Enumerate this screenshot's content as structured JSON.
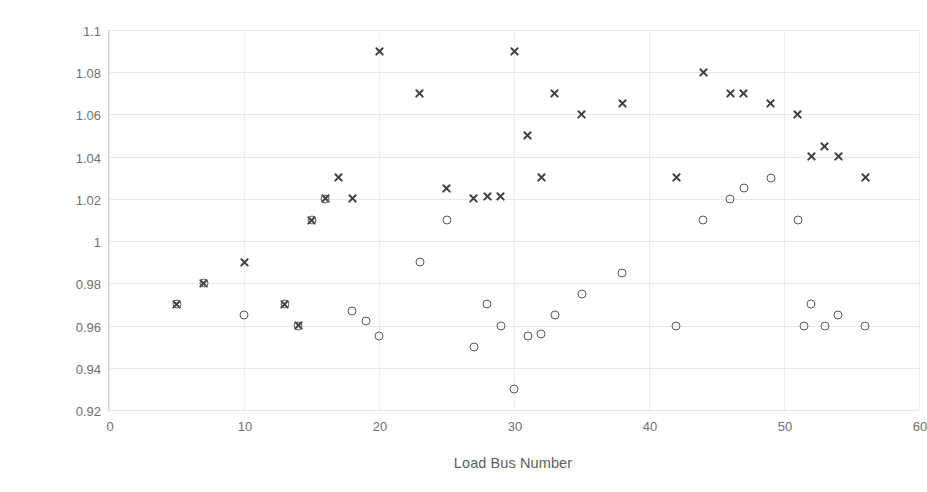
{
  "chart_data": {
    "type": "scatter",
    "title": "",
    "xlabel": "Load Bus Number",
    "ylabel": "Voltage Magnitude in p.u.",
    "xlim": [
      0,
      60
    ],
    "ylim": [
      0.92,
      1.1
    ],
    "xticks": [
      0,
      10,
      20,
      30,
      40,
      50,
      60
    ],
    "yticks": [
      "0.92",
      "0.94",
      "0.96",
      "0.98",
      "1",
      "1.02",
      "1.04",
      "1.06",
      "1.08",
      "1.1"
    ],
    "grid": true,
    "legend": "none",
    "marker_colors": {
      "cross": "#3f3f45",
      "circle": "#5a5a62"
    },
    "series": [
      {
        "name": "series-cross",
        "marker": "x",
        "points": [
          [
            5,
            0.97
          ],
          [
            7,
            0.98
          ],
          [
            10,
            0.99
          ],
          [
            13,
            0.97
          ],
          [
            14,
            0.96
          ],
          [
            15,
            1.01
          ],
          [
            16,
            1.02
          ],
          [
            17,
            1.03
          ],
          [
            18,
            1.02
          ],
          [
            20,
            1.09
          ],
          [
            23,
            1.07
          ],
          [
            25,
            1.025
          ],
          [
            27,
            1.02
          ],
          [
            28,
            1.021
          ],
          [
            29,
            1.021
          ],
          [
            30,
            1.09
          ],
          [
            31,
            1.05
          ],
          [
            32,
            1.03
          ],
          [
            33,
            1.07
          ],
          [
            35,
            1.06
          ],
          [
            38,
            1.065
          ],
          [
            42,
            1.03
          ],
          [
            44,
            1.08
          ],
          [
            46,
            1.07
          ],
          [
            47,
            1.07
          ],
          [
            49,
            1.065
          ],
          [
            51,
            1.06
          ],
          [
            52,
            1.04
          ],
          [
            53,
            1.045
          ],
          [
            54,
            1.04
          ],
          [
            56,
            1.03
          ]
        ]
      },
      {
        "name": "series-circle",
        "marker": "o",
        "points": [
          [
            5,
            0.97
          ],
          [
            7,
            0.98
          ],
          [
            10,
            0.965
          ],
          [
            13,
            0.97
          ],
          [
            14,
            0.96
          ],
          [
            15,
            1.01
          ],
          [
            16,
            1.02
          ],
          [
            18,
            0.967
          ],
          [
            19,
            0.962
          ],
          [
            20,
            0.955
          ],
          [
            23,
            0.99
          ],
          [
            25,
            1.01
          ],
          [
            27,
            0.95
          ],
          [
            28,
            0.97
          ],
          [
            29,
            0.96
          ],
          [
            30,
            0.93
          ],
          [
            31,
            0.955
          ],
          [
            32,
            0.956
          ],
          [
            33,
            0.965
          ],
          [
            35,
            0.975
          ],
          [
            38,
            0.985
          ],
          [
            42,
            0.96
          ],
          [
            44,
            1.01
          ],
          [
            46,
            1.02
          ],
          [
            47,
            1.025
          ],
          [
            49,
            1.03
          ],
          [
            51,
            1.01
          ],
          [
            51.5,
            0.96
          ],
          [
            52,
            0.97
          ],
          [
            53,
            0.96
          ],
          [
            54,
            0.965
          ],
          [
            56,
            0.96
          ]
        ]
      }
    ]
  }
}
